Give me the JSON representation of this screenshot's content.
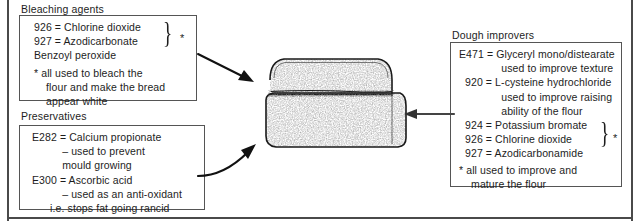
{
  "page": {
    "frame_color": "#4a4a4a",
    "text_color": "#1d1d1d",
    "box_border_color": "#555555"
  },
  "sections": {
    "bleaching": {
      "caption": "Bleaching agents",
      "lines": [
        "926 = Chlorine dioxide",
        "927 = Azodicarbonate",
        "Benzoyl peroxide",
        "* all used to bleach the",
        "    flour and make the bread",
        "    appear white"
      ],
      "brace": "}",
      "star": "*"
    },
    "preservatives": {
      "caption": "Preservatives",
      "lines": [
        "E282 = Calcium propionate",
        "          – used to prevent",
        "          mould growing",
        "E300 = Ascorbic acid",
        "          – used as an anti-oxidant",
        "      i.e. stops fat going rancid"
      ]
    },
    "dough": {
      "caption": "Dough improvers",
      "lines": [
        "E471 = Glyceryl mono/distearate",
        "              used to improve texture",
        "  920 = L-cysteine hydrochloride",
        "              used to improve raising",
        "              ability of the flour",
        "  924 = Potassium bromate",
        "  926 = Chlorine dioxide",
        "  927 = Azodicarbonamide",
        "* all used to improve and",
        "    mature the flour"
      ],
      "brace": "}",
      "star": "*"
    }
  },
  "figure": {
    "name": "bread loaf illustration",
    "alt": "Stippled line drawing of a sliced loaf of bread"
  },
  "arrows": {
    "top": "arrow from bleaching agents box to top crust of loaf",
    "bottom_left": "arrow from preservatives box to body of loaf",
    "right": "arrow from dough improvers box to right side of loaf"
  }
}
